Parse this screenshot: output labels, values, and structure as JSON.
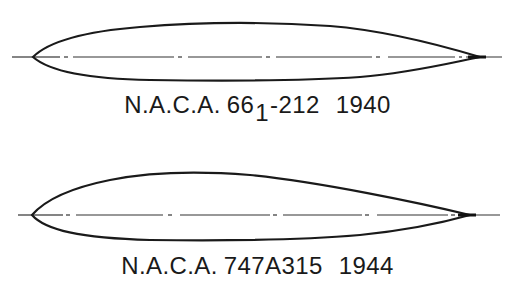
{
  "figure": {
    "airfoils": [
      {
        "id": "naca-66-1-212",
        "label": {
          "prefix": "N.A.C.A.",
          "series_main": "66",
          "series_subscript": "1",
          "series_suffix": "-212",
          "year": "1940"
        },
        "full_label": "N.A.C.A. 66₁-212 1940",
        "chord_line_style": "dash-dot",
        "stroke_color": "#1a1a1a"
      },
      {
        "id": "naca-747a315",
        "label": {
          "prefix": "N.A.C.A.",
          "series_main": "747A315",
          "series_subscript": "",
          "series_suffix": "",
          "year": "1944"
        },
        "full_label": "N.A.C.A. 747A315 1944",
        "chord_line_style": "dash-dot",
        "stroke_color": "#1a1a1a"
      }
    ],
    "background_color": "#ffffff"
  }
}
